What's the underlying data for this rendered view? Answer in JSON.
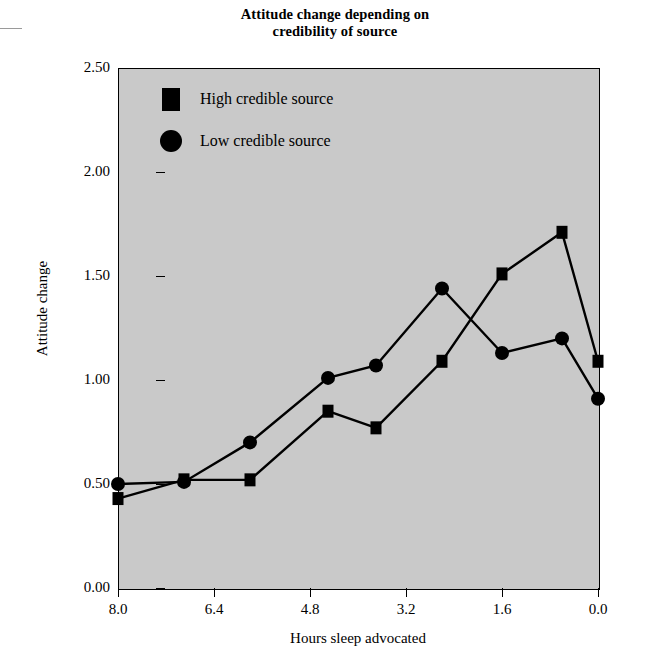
{
  "chart_data": {
    "type": "line",
    "title": "Attitude change depending on credibility of source",
    "title_line1": "Attitude change depending on",
    "title_line2": "credibility of source",
    "xlabel": "Hours sleep advocated",
    "ylabel": "Attitude change",
    "xlim": [
      8.0,
      0.0
    ],
    "ylim": [
      0.0,
      2.5
    ],
    "x_ticks": [
      "8.0",
      "6.4",
      "4.8",
      "3.2",
      "1.6",
      "0.0"
    ],
    "x_tick_values": [
      8.0,
      6.4,
      4.8,
      3.2,
      1.6,
      0.0
    ],
    "y_ticks": [
      "2.50",
      "2.00",
      "1.50",
      "1.00",
      "0.50",
      "0.00"
    ],
    "y_tick_values": [
      2.5,
      2.0,
      1.5,
      1.0,
      0.5,
      0.0
    ],
    "grid": false,
    "x_axis_reversed": true,
    "legend_position": "top-left",
    "plot_background": "#c9c9c9",
    "line_color": "#000000",
    "x": [
      8.0,
      6.9,
      5.8,
      4.5,
      3.7,
      2.6,
      1.6,
      0.6,
      0.0
    ],
    "series": [
      {
        "name": "High credible source",
        "marker": "square",
        "color": "#000000",
        "values": [
          0.43,
          0.52,
          0.52,
          0.85,
          0.77,
          1.09,
          1.51,
          1.71,
          1.09
        ]
      },
      {
        "name": "Low credible source",
        "marker": "circle",
        "color": "#000000",
        "values": [
          0.5,
          0.51,
          0.7,
          1.01,
          1.07,
          1.44,
          1.13,
          1.2,
          0.91
        ]
      }
    ]
  },
  "legend": {
    "items": [
      {
        "label": "High credible source",
        "marker": "square"
      },
      {
        "label": "Low credible source",
        "marker": "circle"
      }
    ]
  }
}
